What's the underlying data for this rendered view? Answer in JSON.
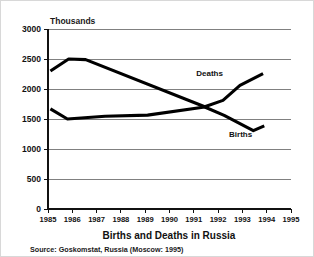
{
  "chart_data": {
    "type": "line",
    "title": "Births and Deaths in Russia",
    "subtitle": "",
    "source_note": "Source: Goskomstat, Russia (Moscow: 1995)",
    "unit_label": "Thousands",
    "xlabel": "",
    "ylabel": "",
    "xlim": [
      1985,
      1995
    ],
    "ylim": [
      0,
      3000
    ],
    "grid": "horizontal",
    "legend": "inline-annotations",
    "y_ticks": [
      0,
      500,
      1000,
      1500,
      2000,
      2500,
      3000
    ],
    "y_tick_labels": [
      "0",
      "500",
      "1000",
      "1500",
      "2000",
      "2500",
      "3000"
    ],
    "x_ticks": [
      1985,
      1986,
      1987,
      1988,
      1989,
      1990,
      1991,
      1992,
      1993,
      1994,
      1995
    ],
    "x_tick_labels": [
      "1985",
      "1986",
      "1987",
      "1988",
      "1989",
      "1990",
      "1991",
      "1992",
      "1993",
      "1994",
      "1995"
    ],
    "series": [
      {
        "name": "Deaths",
        "label": "Deaths",
        "color": "#000000",
        "x": [
          1985.1,
          1985.85,
          1986.55,
          1991.45,
          1992.2,
          1992.9,
          1993.85
        ],
        "values": [
          2300,
          2500,
          2490,
          1705,
          1810,
          2060,
          2255
        ]
      },
      {
        "name": "Births",
        "label": "Births",
        "color": "#000000",
        "x": [
          1985.1,
          1985.8,
          1987.35,
          1989.1,
          1991.45,
          1992.25,
          1993.45,
          1993.9
        ],
        "values": [
          1670,
          1500,
          1545,
          1565,
          1700,
          1560,
          1305,
          1385
        ]
      }
    ],
    "annotations": [
      {
        "text": "Deaths",
        "x": 1991.1,
        "y": 2220
      },
      {
        "text": "Births",
        "x": 1992.45,
        "y": 1205
      }
    ]
  }
}
